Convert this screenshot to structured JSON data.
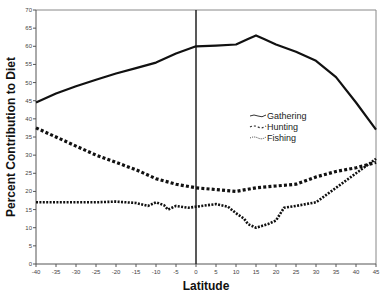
{
  "chart_data": {
    "type": "line",
    "title": "",
    "xlabel": "Latitude",
    "ylabel": "Percent Contribution to Diet",
    "xlim": [
      -40,
      45
    ],
    "ylim": [
      0,
      70
    ],
    "xticks": [
      -40,
      -35,
      -30,
      -25,
      -20,
      -15,
      -10,
      -5,
      0,
      5,
      10,
      15,
      20,
      25,
      30,
      35,
      40,
      45
    ],
    "yticks": [
      0,
      5,
      10,
      15,
      20,
      25,
      30,
      35,
      40,
      45,
      50,
      55,
      60,
      65,
      70
    ],
    "grid": false,
    "vertical_reference_line_x": 0,
    "legend": {
      "position": "inside-center-right",
      "entries": [
        "Gathering",
        "Hunting",
        "Fishing"
      ]
    },
    "series": [
      {
        "name": "Gathering",
        "style": "solid",
        "x": [
          -40,
          -35,
          -30,
          -25,
          -20,
          -15,
          -10,
          -5,
          0,
          5,
          10,
          13,
          15,
          17,
          20,
          25,
          30,
          35,
          40,
          45
        ],
        "values": [
          44.5,
          47,
          49,
          50.8,
          52.5,
          54,
          55.5,
          58,
          60,
          60.2,
          60.5,
          62,
          63,
          62,
          60.5,
          58.5,
          56,
          51.5,
          44.5,
          37
        ]
      },
      {
        "name": "Hunting",
        "style": "dashed",
        "x": [
          -40,
          -35,
          -30,
          -25,
          -20,
          -15,
          -10,
          -5,
          0,
          5,
          10,
          15,
          20,
          25,
          30,
          35,
          40,
          45
        ],
        "values": [
          37.5,
          35,
          32.5,
          30,
          28,
          26,
          23.5,
          22,
          21,
          20.5,
          20,
          21,
          21.5,
          22,
          24,
          25.5,
          26.5,
          28
        ]
      },
      {
        "name": "Fishing",
        "style": "dotted",
        "x": [
          -40,
          -35,
          -30,
          -25,
          -20,
          -15,
          -12,
          -10,
          -8,
          -7,
          -5,
          -2,
          0,
          5,
          8,
          10,
          12,
          13,
          15,
          18,
          20,
          22,
          25,
          30,
          35,
          40,
          45
        ],
        "values": [
          17,
          17,
          17,
          17,
          17.2,
          16.8,
          16,
          17,
          16.2,
          15,
          16,
          15.5,
          15.8,
          16.5,
          15.8,
          14,
          12.5,
          11,
          10,
          11,
          12,
          15.5,
          16,
          17,
          21,
          25,
          29
        ]
      }
    ]
  }
}
